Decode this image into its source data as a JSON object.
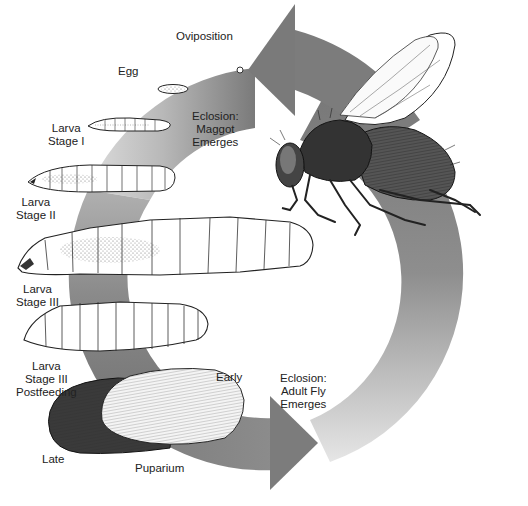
{
  "diagram": {
    "type": "life-cycle",
    "subject": "fly",
    "colors": {
      "ring_dark": "#7a7a7a",
      "ring_mid": "#9a9a9a",
      "ring_light": "#d6d6d6",
      "background": "#ffffff",
      "ink": "#1a1a1a"
    },
    "labels": {
      "oviposition": "Oviposition",
      "egg": "Egg",
      "eclosion_maggot": "Eclosion:\nMaggot\nEmerges",
      "larva_stage_1": "Larva\nStage I",
      "larva_stage_2": "Larva\nStage II",
      "larva_stage_3": "Larva\nStage III",
      "larva_stage_3_postfeeding": "Larva\nStage III\nPostfeeding",
      "puparium_early": "Early",
      "puparium_late": "Late",
      "puparium": "Puparium",
      "eclosion_adult": "Eclosion:\nAdult Fly\nEmerges"
    },
    "stages": [
      {
        "id": "oviposition",
        "name": "Oviposition"
      },
      {
        "id": "egg",
        "name": "Egg"
      },
      {
        "id": "eclosion-maggot",
        "name": "Eclosion: Maggot Emerges"
      },
      {
        "id": "larva-1",
        "name": "Larva Stage I"
      },
      {
        "id": "larva-2",
        "name": "Larva Stage II"
      },
      {
        "id": "larva-3",
        "name": "Larva Stage III"
      },
      {
        "id": "larva-3-postfeeding",
        "name": "Larva Stage III Postfeeding"
      },
      {
        "id": "puparium-early",
        "name": "Puparium Early"
      },
      {
        "id": "puparium-late",
        "name": "Puparium Late"
      },
      {
        "id": "eclosion-adult",
        "name": "Eclosion: Adult Fly Emerges"
      },
      {
        "id": "adult-fly",
        "name": "Adult fly"
      }
    ]
  }
}
